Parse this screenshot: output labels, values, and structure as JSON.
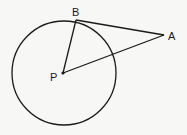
{
  "diagram": {
    "type": "geometry",
    "circle": {
      "center_label": "P",
      "cx": 64,
      "cy": 73,
      "r": 52
    },
    "points": {
      "P": {
        "label": "P",
        "x": 63,
        "y": 73
      },
      "B": {
        "label": "B",
        "x": 76,
        "y": 20
      },
      "A": {
        "label": "A",
        "x": 164,
        "y": 35
      }
    },
    "segments": [
      {
        "from": "P",
        "to": "B"
      },
      {
        "from": "B",
        "to": "A"
      },
      {
        "from": "P",
        "to": "A"
      }
    ],
    "stroke_color": "#1a1a1a",
    "background_color": "#f7f7f5"
  }
}
